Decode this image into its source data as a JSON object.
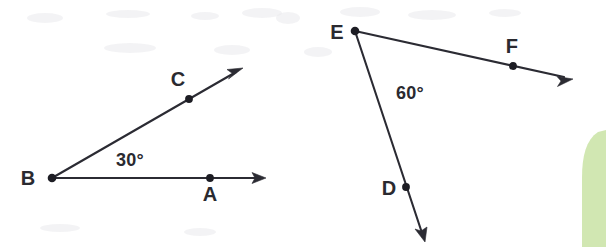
{
  "figure": {
    "background_color": "#ffffff",
    "width": 606,
    "height": 247,
    "angles": [
      {
        "id": "angle-abc",
        "vertex_label": "B",
        "measure_label": "30°",
        "measure_degrees": 30,
        "shading_color": "#3a4a8c",
        "shading_style": "gradient-fade-out",
        "vertex": {
          "x": 52,
          "y": 178
        },
        "label_position": {
          "x": 28,
          "y": 185
        },
        "measure_label_position": {
          "x": 130,
          "y": 165
        },
        "rays": [
          {
            "id": "ray-ba",
            "through_point_label": "A",
            "through_point": {
              "x": 210,
              "y": 178
            },
            "through_point_label_position": {
              "x": 210,
              "y": 200
            },
            "end": {
              "x": 266,
              "y": 178
            },
            "arrow": true
          },
          {
            "id": "ray-bc",
            "through_point_label": "C",
            "through_point": {
              "x": 189,
              "y": 99
            },
            "through_point_label_position": {
              "x": 178,
              "y": 85
            },
            "end": {
              "x": 243,
              "y": 68
            },
            "arrow": true
          }
        ]
      },
      {
        "id": "angle-def",
        "vertex_label": "E",
        "measure_label": "60°",
        "measure_degrees": 60,
        "shading_color": "#e8536a",
        "shading_style": "gradient-fade-out",
        "vertex": {
          "x": 355,
          "y": 31
        },
        "label_position": {
          "x": 337,
          "y": 38
        },
        "measure_label_position": {
          "x": 410,
          "y": 98
        },
        "rays": [
          {
            "id": "ray-ef",
            "through_point_label": "F",
            "through_point": {
              "x": 513,
              "y": 66
            },
            "through_point_label_position": {
              "x": 512,
              "y": 52
            },
            "end": {
              "x": 573,
              "y": 79
            },
            "arrow": true
          },
          {
            "id": "ray-ed",
            "through_point_label": "D",
            "through_point": {
              "x": 406,
              "y": 187
            },
            "through_point_label_position": {
              "x": 389,
              "y": 194
            },
            "end": {
              "x": 425,
              "y": 242
            },
            "arrow": true
          }
        ]
      }
    ],
    "decorations": [
      {
        "id": "page-edge-bleed",
        "name": "green-page-tab",
        "color": "#c9e3a4"
      }
    ]
  }
}
